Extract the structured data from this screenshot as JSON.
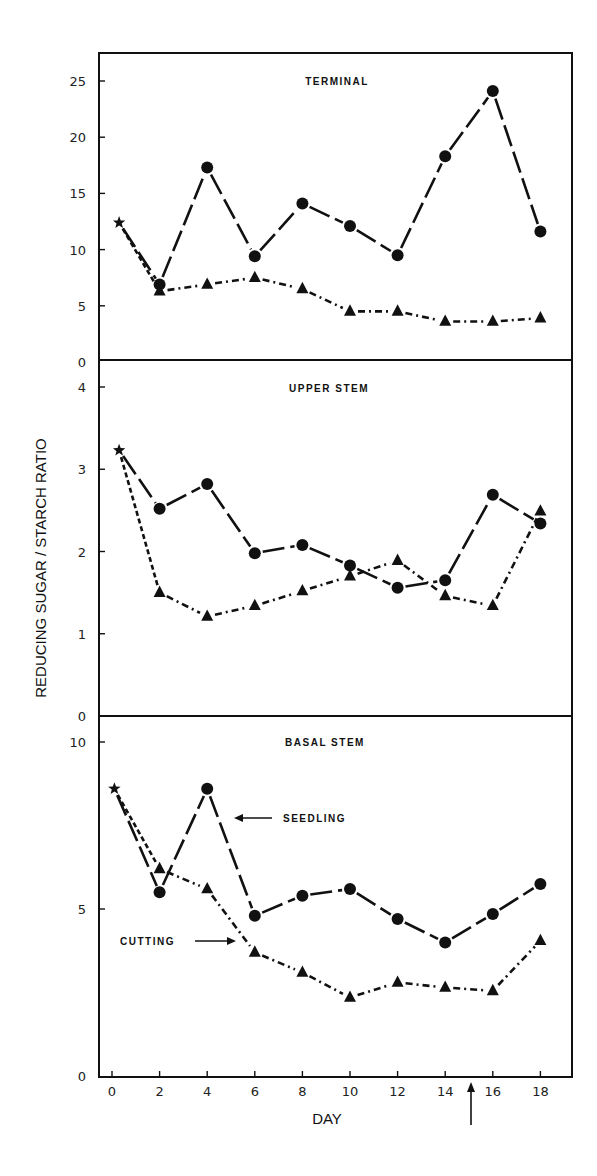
{
  "chart_data": {
    "type": "line",
    "title": "",
    "xlabel": "DAY",
    "ylabel": "REDUCING SUGAR / STARCH RATIO",
    "x": [
      2,
      4,
      6,
      8,
      10,
      12,
      14,
      16,
      18
    ],
    "x_ticks": [
      0,
      2,
      4,
      6,
      8,
      10,
      12,
      14,
      16,
      18
    ],
    "xlim": [
      -0.5,
      19.5
    ],
    "grid": false,
    "legend": "inline annotations (SEEDLING, CUTTING arrows in BASAL STEM panel)",
    "marker_arrow_day": 15,
    "panels": [
      {
        "title": "TERMINAL",
        "ylim": [
          0,
          27
        ],
        "y_ticks": [
          0,
          5,
          10,
          15,
          20,
          25
        ],
        "initial": {
          "day": 0.3,
          "value": 12.4,
          "marker": "star"
        },
        "series": [
          {
            "name": "Seedling",
            "marker": "circle",
            "line": "solid-dashed",
            "values": [
              6.9,
              17.3,
              9.4,
              14.1,
              12.1,
              9.5,
              18.3,
              24.1,
              11.6
            ]
          },
          {
            "name": "Cutting",
            "marker": "triangle",
            "line": "dash-dot",
            "values": [
              6.3,
              6.9,
              7.5,
              6.5,
              4.5,
              4.5,
              3.6,
              3.6,
              3.9
            ]
          }
        ]
      },
      {
        "title": "UPPER STEM",
        "ylim": [
          0,
          4.35
        ],
        "y_ticks": [
          0,
          1,
          2,
          3,
          4
        ],
        "initial": {
          "day": 0.3,
          "value": 3.23,
          "marker": "star"
        },
        "series": [
          {
            "name": "Seedling",
            "marker": "circle",
            "line": "solid-dashed",
            "values": [
              2.52,
              2.82,
              1.98,
              2.08,
              1.83,
              1.56,
              1.65,
              2.69,
              2.34
            ]
          },
          {
            "name": "Cutting",
            "marker": "triangle",
            "line": "dash-dot",
            "values": [
              1.5,
              1.21,
              1.34,
              1.52,
              1.7,
              1.89,
              1.46,
              1.34,
              2.49
            ]
          }
        ]
      },
      {
        "title": "BASAL STEM",
        "ylim": [
          0,
          10.8
        ],
        "y_ticks": [
          0,
          5,
          10
        ],
        "initial": {
          "day": 0.1,
          "value": 8.6,
          "marker": "star"
        },
        "series": [
          {
            "name": "Seedling",
            "marker": "circle",
            "line": "solid-dashed",
            "values": [
              5.5,
              8.6,
              4.8,
              5.4,
              5.6,
              4.7,
              4.0,
              4.85,
              5.75
            ]
          },
          {
            "name": "Cutting",
            "marker": "triangle",
            "line": "dash-dot",
            "values": [
              6.2,
              5.6,
              3.7,
              3.1,
              2.35,
              2.8,
              2.65,
              2.55,
              4.05
            ]
          }
        ],
        "annotations": [
          {
            "text": "SEEDLING",
            "arrow": "left",
            "points_to": "Seedling"
          },
          {
            "text": "CUTTING",
            "arrow": "right",
            "points_to": "Cutting"
          }
        ]
      }
    ]
  },
  "labels": {
    "ylabel": "REDUCING SUGAR / STARCH RATIO",
    "xlabel": "DAY",
    "panel1_title": "TERMINAL",
    "panel2_title": "UPPER STEM",
    "panel3_title": "BASAL STEM",
    "seedling": "SEEDLING",
    "cutting": "CUTTING"
  },
  "colors": {
    "ink": "#111111",
    "background": "#ffffff"
  }
}
